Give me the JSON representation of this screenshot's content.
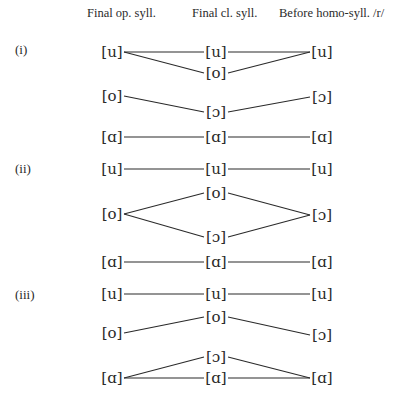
{
  "headers": {
    "col1": "Final op. syll.",
    "col2": "Final cl. syll.",
    "col3": "Before homo-syll. /r/"
  },
  "sections": [
    {
      "label": "(i)",
      "nodes": [
        {
          "id": "i_u1",
          "text": "[u]",
          "x": 112,
          "y": 52
        },
        {
          "id": "i_u2",
          "text": "[u]",
          "x": 216,
          "y": 52
        },
        {
          "id": "i_u3",
          "text": "[u]",
          "x": 322,
          "y": 52
        },
        {
          "id": "i_o2",
          "text": "[o]",
          "x": 216,
          "y": 73
        },
        {
          "id": "i_o1",
          "text": "[o]",
          "x": 112,
          "y": 96
        },
        {
          "id": "i_c2",
          "text": "[ɔ]",
          "x": 216,
          "y": 112
        },
        {
          "id": "i_c3",
          "text": "[ɔ]",
          "x": 322,
          "y": 97
        },
        {
          "id": "i_a1",
          "text": "[ɑ]",
          "x": 112,
          "y": 137
        },
        {
          "id": "i_a2",
          "text": "[ɑ]",
          "x": 216,
          "y": 137
        },
        {
          "id": "i_a3",
          "text": "[ɑ]",
          "x": 322,
          "y": 137
        }
      ]
    },
    {
      "label": "(ii)",
      "nodes": [
        {
          "id": "ii_u1",
          "text": "[u]",
          "x": 112,
          "y": 169
        },
        {
          "id": "ii_u2",
          "text": "[u]",
          "x": 216,
          "y": 169
        },
        {
          "id": "ii_u3",
          "text": "[u]",
          "x": 322,
          "y": 169
        },
        {
          "id": "ii_o2",
          "text": "[o]",
          "x": 216,
          "y": 193
        },
        {
          "id": "ii_o1",
          "text": "[o]",
          "x": 112,
          "y": 214
        },
        {
          "id": "ii_c3",
          "text": "[ɔ]",
          "x": 322,
          "y": 215
        },
        {
          "id": "ii_c2",
          "text": "[ɔ]",
          "x": 216,
          "y": 237
        },
        {
          "id": "ii_a1",
          "text": "[ɑ]",
          "x": 112,
          "y": 262
        },
        {
          "id": "ii_a2",
          "text": "[ɑ]",
          "x": 216,
          "y": 262
        },
        {
          "id": "ii_a3",
          "text": "[ɑ]",
          "x": 322,
          "y": 262
        }
      ]
    },
    {
      "label": "(iii)",
      "nodes": [
        {
          "id": "iii_u1",
          "text": "[u]",
          "x": 112,
          "y": 294
        },
        {
          "id": "iii_u2",
          "text": "[u]",
          "x": 216,
          "y": 294
        },
        {
          "id": "iii_u3",
          "text": "[u]",
          "x": 322,
          "y": 294
        },
        {
          "id": "iii_o2",
          "text": "[o]",
          "x": 216,
          "y": 317
        },
        {
          "id": "iii_o1",
          "text": "[o]",
          "x": 112,
          "y": 333
        },
        {
          "id": "iii_c3",
          "text": "[ɔ]",
          "x": 322,
          "y": 335
        },
        {
          "id": "iii_c2",
          "text": "[ɔ]",
          "x": 216,
          "y": 357
        },
        {
          "id": "iii_a1",
          "text": "[ɑ]",
          "x": 112,
          "y": 378
        },
        {
          "id": "iii_a2",
          "text": "[ɑ]",
          "x": 216,
          "y": 378
        },
        {
          "id": "iii_a3",
          "text": "[ɑ]",
          "x": 322,
          "y": 378
        }
      ]
    }
  ],
  "edges": [
    [
      "i_u1",
      "i_u2"
    ],
    [
      "i_u2",
      "i_u3"
    ],
    [
      "i_u1",
      "i_o2"
    ],
    [
      "i_o2",
      "i_u3"
    ],
    [
      "i_o1",
      "i_c2"
    ],
    [
      "i_c2",
      "i_c3"
    ],
    [
      "i_a1",
      "i_a2"
    ],
    [
      "i_a2",
      "i_a3"
    ],
    [
      "ii_u1",
      "ii_u2"
    ],
    [
      "ii_u2",
      "ii_u3"
    ],
    [
      "ii_o1",
      "ii_o2"
    ],
    [
      "ii_o1",
      "ii_c2"
    ],
    [
      "ii_o2",
      "ii_c3"
    ],
    [
      "ii_c2",
      "ii_c3"
    ],
    [
      "ii_a1",
      "ii_a2"
    ],
    [
      "ii_a2",
      "ii_a3"
    ],
    [
      "iii_u1",
      "iii_u2"
    ],
    [
      "iii_u2",
      "iii_u3"
    ],
    [
      "iii_o1",
      "iii_o2"
    ],
    [
      "iii_o2",
      "iii_c3"
    ],
    [
      "iii_a1",
      "iii_c2"
    ],
    [
      "iii_c2",
      "iii_a3"
    ],
    [
      "iii_a1",
      "iii_a2"
    ],
    [
      "iii_a2",
      "iii_a3"
    ]
  ]
}
